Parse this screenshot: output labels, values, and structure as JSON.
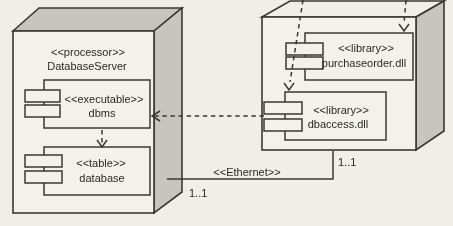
{
  "colors": {
    "background": "#f0eee9",
    "surface": "#f3f1ec",
    "shade": "#c8c5bf",
    "line": "#3b3833",
    "text": "#2b2926"
  },
  "nodes": {
    "database_server": {
      "stereotype": "<<processor>>",
      "name": "DatabaseServer"
    }
  },
  "components": {
    "dbms": {
      "stereotype": "<<executable>>",
      "name": "dbms"
    },
    "database": {
      "stereotype": "<<table>>",
      "name": "database"
    },
    "purchaseorder": {
      "stereotype": "<<library>>",
      "name": "purchaseorder.dll"
    },
    "dbaccess": {
      "stereotype": "<<library>>",
      "name": "dbaccess.dll"
    }
  },
  "connectors": {
    "ethernet": {
      "label": "<<Ethernet>>",
      "left_multiplicity": "1..1",
      "right_multiplicity": "1..1"
    }
  }
}
